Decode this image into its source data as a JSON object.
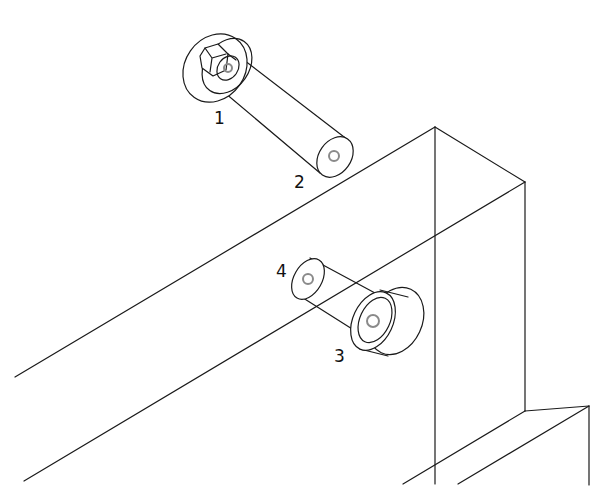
{
  "diagram": {
    "type": "isometric-assembly-drawing",
    "labels": [
      {
        "id": "1",
        "text": "1",
        "x": 214,
        "y": 124
      },
      {
        "id": "2",
        "text": "2",
        "x": 294,
        "y": 188
      },
      {
        "id": "3",
        "text": "3",
        "x": 334,
        "y": 362
      },
      {
        "id": "4",
        "text": "4",
        "x": 276,
        "y": 277
      }
    ],
    "parts": [
      {
        "label": "1",
        "description": "nut with washer on pin end"
      },
      {
        "label": "2",
        "description": "pin end with center hole"
      },
      {
        "label": "3",
        "description": "bushing / collar with center hole"
      },
      {
        "label": "4",
        "description": "pin end with center hole"
      }
    ],
    "colors": {
      "line": "#1a1a1a",
      "hole": "#8a8a8a",
      "background": "#ffffff"
    }
  }
}
